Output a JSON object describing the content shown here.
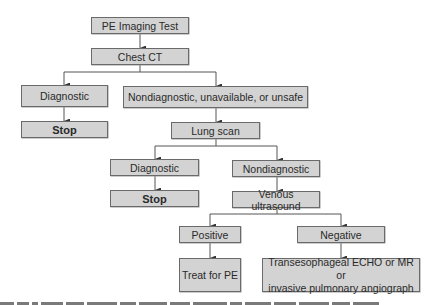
{
  "diagram": {
    "colors": {
      "box_fill": "#d3d3d3",
      "box_border": "#6a6a6a",
      "line": "#555555",
      "text": "#2a2a2a"
    },
    "nodes": {
      "start": "PE Imaging Test",
      "chest_ct": "Chest CT",
      "ct_diagnostic": "Diagnostic",
      "ct_stop": "Stop",
      "ct_nondiagnostic": "Nondiagnostic, unavailable, or unsafe",
      "lung_scan": "Lung scan",
      "ls_diagnostic": "Diagnostic",
      "ls_stop": "Stop",
      "ls_nondiagnostic": "Nondiagnostic",
      "venous_us": "Venous ultrasound",
      "us_positive": "Positive",
      "treat_pe": "Treat for PE",
      "us_negative": "Negative",
      "further_line1": "Transesophageal ECHO or MR or",
      "further_line2": "invasive pulmonary angiograph"
    },
    "edges": [
      [
        "start",
        "chest_ct"
      ],
      [
        "chest_ct",
        "ct_diagnostic"
      ],
      [
        "chest_ct",
        "ct_nondiagnostic"
      ],
      [
        "ct_diagnostic",
        "ct_stop"
      ],
      [
        "ct_nondiagnostic",
        "lung_scan"
      ],
      [
        "lung_scan",
        "ls_diagnostic"
      ],
      [
        "lung_scan",
        "ls_nondiagnostic"
      ],
      [
        "ls_diagnostic",
        "ls_stop"
      ],
      [
        "ls_nondiagnostic",
        "venous_us"
      ],
      [
        "venous_us",
        "us_positive"
      ],
      [
        "venous_us",
        "us_negative"
      ],
      [
        "us_positive",
        "treat_pe"
      ],
      [
        "us_negative",
        "further"
      ]
    ]
  }
}
